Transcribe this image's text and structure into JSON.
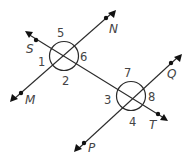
{
  "diagram": {
    "type": "geometry-transversal",
    "lines": [
      {
        "name": "transversal",
        "from": "S",
        "to": "T"
      },
      {
        "name": "line-MN",
        "from": "M",
        "to": "N"
      },
      {
        "name": "line-PQ",
        "from": "P",
        "to": "Q"
      }
    ],
    "points": {
      "S": "S",
      "T": "T",
      "M": "M",
      "N": "N",
      "P": "P",
      "Q": "Q"
    },
    "angles": {
      "a1": "1",
      "a2": "2",
      "a3": "3",
      "a4": "4",
      "a5": "5",
      "a6": "6",
      "a7": "7",
      "a8": "8"
    },
    "colors": {
      "line": "#2b2b2b",
      "label": "#444444",
      "background": "#ffffff"
    }
  }
}
